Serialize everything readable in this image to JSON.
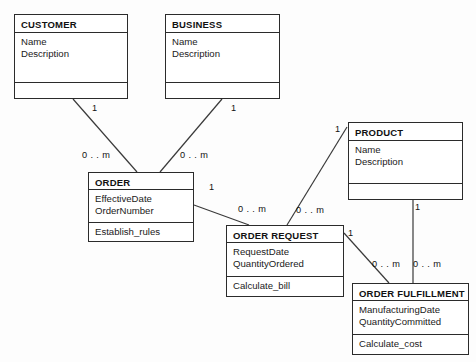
{
  "diagram": {
    "background_color": "#fdfdfd",
    "line_color": "#3a3a3a",
    "text_color": "#111111"
  },
  "classes": [
    {
      "id": "customer",
      "name": "CUSTOMER",
      "attributes": [
        "Name",
        "Description"
      ],
      "operations": [],
      "x": 14,
      "y": 14,
      "w": 114,
      "h": 85,
      "name_h": 18,
      "attr_h": 36
    },
    {
      "id": "business",
      "name": "BUSINESS",
      "attributes": [
        "Name",
        "Description"
      ],
      "operations": [],
      "x": 165,
      "y": 14,
      "w": 115,
      "h": 85,
      "name_h": 18,
      "attr_h": 36
    },
    {
      "id": "product",
      "name": "PRODUCT",
      "attributes": [
        "Name",
        "Description"
      ],
      "operations": [],
      "x": 348,
      "y": 122,
      "w": 115,
      "h": 78,
      "name_h": 18,
      "attr_h": 35
    },
    {
      "id": "order",
      "name": "ORDER",
      "attributes": [
        "EffectiveDate",
        "OrderNumber"
      ],
      "operations": [
        "Establish_rules"
      ],
      "x": 88,
      "y": 172,
      "w": 106,
      "h": 70,
      "name_h": 17,
      "attr_h": 33
    },
    {
      "id": "order_request",
      "name": "ORDER REQUEST",
      "attributes": [
        "RequestDate",
        "QuantityOrdered"
      ],
      "operations": [
        "Calculate_bill"
      ],
      "x": 226,
      "y": 225,
      "w": 118,
      "h": 72,
      "name_h": 17,
      "attr_h": 34
    },
    {
      "id": "order_fulfillment",
      "name": "ORDER FULFILLMENT",
      "attributes": [
        "ManufacturingDate",
        "QuantityCommitted"
      ],
      "operations": [
        "Calculate_cost"
      ],
      "x": 352,
      "y": 283,
      "w": 117,
      "h": 72,
      "name_h": 17,
      "attr_h": 34
    }
  ],
  "associations": [
    {
      "id": "customer-order",
      "from": "customer",
      "to": "order",
      "x1": 73,
      "y1": 99,
      "x2": 137,
      "y2": 172
    },
    {
      "id": "business-order",
      "from": "business",
      "to": "order",
      "x1": 222,
      "y1": 99,
      "x2": 160,
      "y2": 172
    },
    {
      "id": "order-order_request",
      "from": "order",
      "to": "order_request",
      "x1": 194,
      "y1": 205,
      "x2": 249,
      "y2": 225
    },
    {
      "id": "product-order_request",
      "from": "product",
      "to": "order_request",
      "x1": 347,
      "y1": 127,
      "x2": 287,
      "y2": 225
    },
    {
      "id": "order_request-order_fulfillment",
      "from": "order_request",
      "to": "order_fulfillment",
      "x1": 344,
      "y1": 233,
      "x2": 389,
      "y2": 283
    },
    {
      "id": "product-order_fulfillment",
      "from": "product",
      "to": "order_fulfillment",
      "x1": 413,
      "y1": 200,
      "x2": 413,
      "y2": 283
    }
  ],
  "multiplicities": [
    {
      "id": "customer-end",
      "label": "1",
      "x": 92,
      "y": 103
    },
    {
      "id": "business-end",
      "label": "1",
      "x": 231,
      "y": 103
    },
    {
      "id": "order-from-customer",
      "label": "0 . . m",
      "x": 82,
      "y": 150
    },
    {
      "id": "order-from-business",
      "label": "0 . . m",
      "x": 180,
      "y": 150
    },
    {
      "id": "order-to-request",
      "label": "1",
      "x": 209,
      "y": 182
    },
    {
      "id": "request-from-order",
      "label": "0 . . m",
      "x": 238,
      "y": 204
    },
    {
      "id": "product-to-request",
      "label": "1",
      "x": 335,
      "y": 124
    },
    {
      "id": "request-from-product",
      "label": "0 . . m",
      "x": 296,
      "y": 205
    },
    {
      "id": "request-to-fulfill",
      "label": "1",
      "x": 348,
      "y": 228
    },
    {
      "id": "fulfill-from-request",
      "label": "0 . . m",
      "x": 372,
      "y": 259
    },
    {
      "id": "product-to-fulfill",
      "label": "1",
      "x": 415,
      "y": 202
    },
    {
      "id": "fulfill-from-product",
      "label": "0 . . m",
      "x": 413,
      "y": 259
    }
  ]
}
